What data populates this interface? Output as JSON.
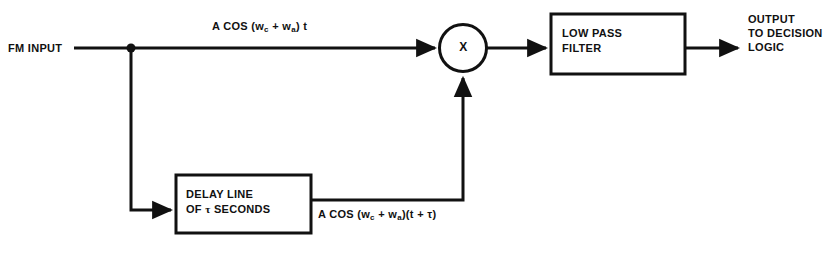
{
  "diagram": {
    "background_color": "#ffffff",
    "line_color": "#111111",
    "labels": {
      "fm_input": "FM INPUT",
      "multiplier_symbol": "X",
      "output_line1": "OUTPUT",
      "output_line2": "TO DECISION",
      "output_line3": "LOGIC"
    },
    "blocks": {
      "delay_line": {
        "line1": "DELAY LINE",
        "line2_prefix": "OF ",
        "line2_symbol": "τ",
        "line2_suffix": " SECONDS"
      },
      "low_pass_filter": {
        "line1": "LOW PASS",
        "line2": "FILTER"
      }
    },
    "signals": {
      "top": {
        "prefix": "A COS (w",
        "sub1": "c",
        "mid": " + w",
        "sub2": "a",
        "suffix": ") t"
      },
      "delayed": {
        "prefix": "A COS (w",
        "sub1": "c",
        "mid": " + w",
        "sub2": "a",
        "suffix": ")(t + τ)"
      }
    }
  }
}
